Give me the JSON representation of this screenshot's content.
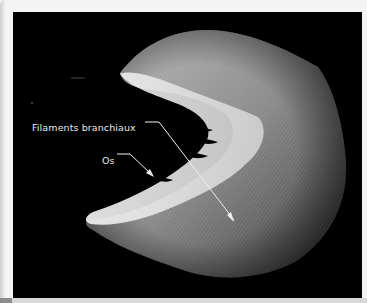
{
  "figure": {
    "background_color": "#000000",
    "labels": [
      {
        "id": "filaments",
        "text": "Filaments branchiaux"
      },
      {
        "id": "os",
        "text": "Os"
      }
    ],
    "colors": {
      "label_text": "#e8e8e8",
      "callout_line": "#f0f0f0",
      "page_background": "#f4f4f4"
    }
  }
}
